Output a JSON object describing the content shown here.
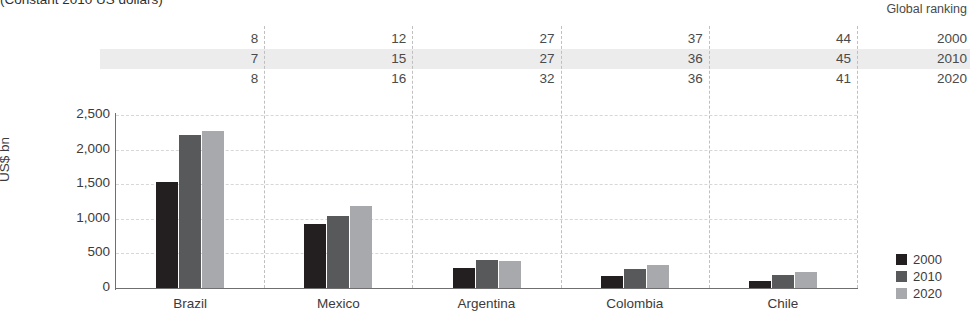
{
  "subtitle": "(Constant 2010 US dollars)",
  "ranking_table": {
    "header": "Global ranking",
    "years": [
      "2000",
      "2010",
      "2020"
    ],
    "rows": [
      {
        "year": "2000",
        "values": [
          "8",
          "12",
          "27",
          "37",
          "44"
        ]
      },
      {
        "year": "2010",
        "values": [
          "7",
          "15",
          "27",
          "36",
          "45"
        ]
      },
      {
        "year": "2020",
        "values": [
          "8",
          "16",
          "32",
          "36",
          "41"
        ]
      }
    ]
  },
  "legend": {
    "entries": [
      {
        "label": "2000",
        "color": "#231f20"
      },
      {
        "label": "2010",
        "color": "#58595b"
      },
      {
        "label": "2020",
        "color": "#a7a9ac"
      }
    ]
  },
  "chart_data": {
    "type": "bar",
    "title": "",
    "subtitle": "(Constant 2010 US dollars)",
    "xlabel": "",
    "ylabel": "US$ bn",
    "categories": [
      "Brazil",
      "Mexico",
      "Argentina",
      "Colombia",
      "Chile"
    ],
    "series": [
      {
        "name": "2000",
        "color": "#231f20",
        "values": [
          1530,
          920,
          290,
          175,
          105
        ]
      },
      {
        "name": "2010",
        "color": "#58595b",
        "values": [
          2210,
          1040,
          400,
          270,
          195
        ]
      },
      {
        "name": "2020",
        "color": "#a7a9ac",
        "values": [
          2270,
          1180,
          385,
          330,
          225
        ]
      }
    ],
    "ylim": [
      0,
      2500
    ],
    "yticks": [
      0,
      500,
      1000,
      1500,
      2000,
      2500
    ],
    "ytick_labels": [
      "0",
      "500",
      "1,000",
      "1,500",
      "2,000",
      "2,500"
    ],
    "grid": true,
    "legend_position": "right",
    "global_ranking": {
      "2000": [
        8,
        12,
        27,
        37,
        44
      ],
      "2010": [
        7,
        15,
        27,
        36,
        45
      ],
      "2020": [
        8,
        16,
        32,
        36,
        41
      ]
    }
  }
}
